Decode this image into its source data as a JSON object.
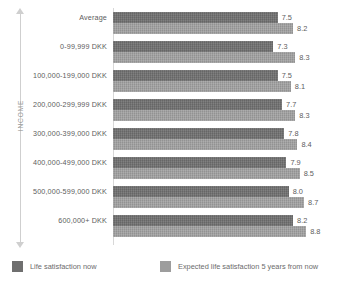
{
  "chart_data": {
    "type": "bar",
    "orientation": "horizontal",
    "title": "",
    "xlabel": "",
    "ylabel": "INCOME",
    "categories": [
      "Average",
      "0-99,999 DKK",
      "100,000-199,000 DKK",
      "200,000-299,999 DKK",
      "300,000-399,000 DKK",
      "400,000-499,000 DKK",
      "500,000-599,000 DKK",
      "600,000+ DKK"
    ],
    "series": [
      {
        "name": "Life satisfaction now",
        "color": "#6f6f6f",
        "values": [
          7.5,
          7.3,
          7.5,
          7.7,
          7.8,
          7.9,
          8.0,
          8.2
        ]
      },
      {
        "name": "Expected life satisfaction 5 years from now",
        "color": "#9d9d9d",
        "values": [
          8.2,
          8.3,
          8.1,
          8.3,
          8.4,
          8.5,
          8.7,
          8.8
        ]
      }
    ],
    "value_labels": {
      "now": [
        "7.5",
        "7.3",
        "7.5",
        "7.7",
        "7.8",
        "7.9",
        "8.0",
        "8.2"
      ],
      "expected": [
        "8.2",
        "8.3",
        "8.1",
        "8.3",
        "8.4",
        "8.5",
        "8.7",
        "8.8"
      ]
    },
    "xlim": [
      0,
      9.2
    ],
    "grid": false,
    "legend_position": "bottom"
  },
  "axis": {
    "income_label": "INCOME"
  },
  "legend": {
    "items": [
      {
        "label": "Life satisfaction now",
        "color": "#6f6f6f"
      },
      {
        "label": "Expected life satisfaction 5 years from now",
        "color": "#9d9d9d"
      }
    ]
  }
}
